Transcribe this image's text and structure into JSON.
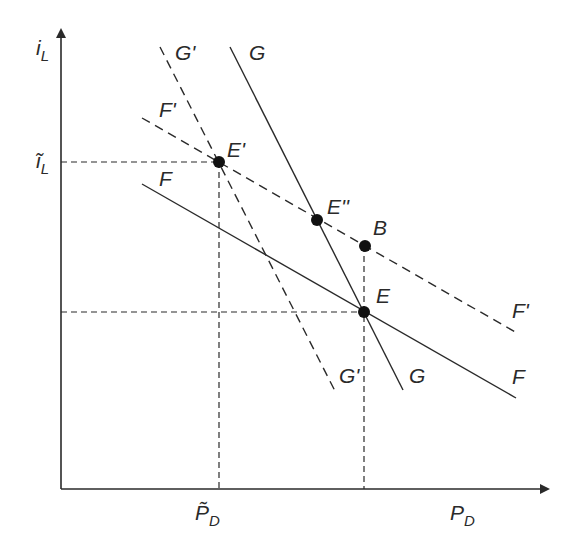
{
  "diagram": {
    "axes": {
      "y_label": "i",
      "y_label_sub": "L",
      "x_label": "P",
      "x_label_sub": "D",
      "y_tick_label": "ĩ",
      "y_tick_label_sub": "L",
      "x_tick_label": "P̃",
      "x_tick_label_sub": "D"
    },
    "curves": {
      "G_prime_top": "G'",
      "G_prime_bottom": "G'",
      "G_top": "G",
      "G_bottom": "G",
      "F_prime_top": "F'",
      "F_prime_bottom": "F'",
      "F_top": "F",
      "F_bottom": "F"
    },
    "points": {
      "E_prime": "E'",
      "E_double_prime": "E''",
      "B": "B",
      "E": "E"
    },
    "colors": {
      "ink": "#2a2a2a",
      "background": "#ffffff"
    }
  }
}
